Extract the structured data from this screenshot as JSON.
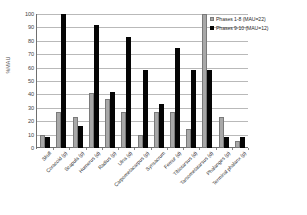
{
  "chart_data": {
    "type": "bar",
    "title": "",
    "xlabel": "",
    "ylabel": "%MAU",
    "ylim": [
      0,
      100
    ],
    "ytick_step": 10,
    "yticks": [
      "0",
      "10",
      "20",
      "30",
      "40",
      "50",
      "60",
      "70",
      "80",
      "90",
      "100"
    ],
    "grid": true,
    "legend_position": "top-right",
    "categories": [
      "Skull",
      "Coracoid (p)",
      "Scapula (p)",
      "Humerus (d)",
      "Radius (p)",
      "Ulna (d)",
      "Carpometacarpus (p)",
      "Synsacrum",
      "Femur (d)",
      "Tibiotarsus (d)",
      "Tarsometatarsus (d)",
      "Phalanges (p)",
      "Terminal phalanx (p)"
    ],
    "series": [
      {
        "name": "Phases 1-8 (MAU=22)",
        "color": "#a8a8a8",
        "values": [
          9.5,
          27,
          23,
          41,
          36.5,
          27,
          9.5,
          27,
          27,
          14,
          100,
          23,
          5
        ]
      },
      {
        "name": "Phases 9-10 (MAU=12)",
        "color": "#050505",
        "values": [
          8,
          100,
          16.5,
          92,
          41.5,
          83,
          58,
          33,
          75,
          58,
          58,
          8.5,
          8.5
        ]
      }
    ]
  }
}
